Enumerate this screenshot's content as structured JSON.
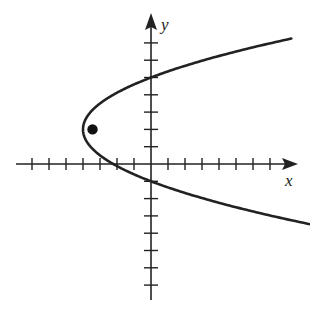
{
  "chart_data": {
    "type": "line",
    "title": "",
    "xlabel": "x",
    "ylabel": "y",
    "equation": "x = (4/9)(y - 2)^2 - 4",
    "vertex": [
      -4,
      2
    ],
    "focus": [
      -3.44,
      2
    ],
    "xlim": [
      -8,
      8
    ],
    "ylim": [
      -8,
      8
    ],
    "x_ticks": [
      -7,
      -6,
      -5,
      -4,
      -3,
      -2,
      -1,
      1,
      2,
      3,
      4,
      5,
      6,
      7
    ],
    "y_ticks": [
      -7,
      -6,
      -5,
      -4,
      -3,
      -2,
      -1,
      1,
      2,
      3,
      4,
      5,
      6,
      7
    ],
    "tick_labels_shown": false,
    "grid": false,
    "intercepts": {
      "y_axis": [
        5,
        -1
      ],
      "x_axis": [
        -2.22
      ]
    },
    "points": [
      {
        "x": -3.44,
        "y": 2,
        "label": "focus"
      }
    ]
  },
  "labels": {
    "x_axis": "x",
    "y_axis": "y"
  }
}
